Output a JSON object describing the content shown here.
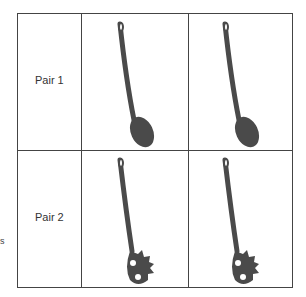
{
  "rows": [
    {
      "label": "Pair 1",
      "utensil": "solid-spoon-icon"
    },
    {
      "label": "Pair 2",
      "utensil": "pasta-server-icon"
    }
  ],
  "fragment": "s",
  "colors": {
    "utensil": "#4a4a4a",
    "border": "#444444"
  }
}
